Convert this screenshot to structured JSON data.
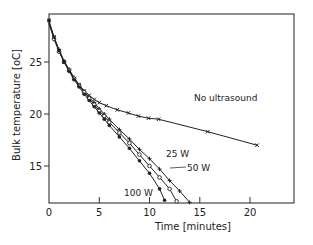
{
  "chart_data": {
    "type": "line",
    "title": "",
    "xlabel": "Time [minutes]",
    "ylabel": "Bulk temperature [oC]",
    "xlim": [
      0,
      24.5
    ],
    "ylim": [
      11.4,
      29.6
    ],
    "xticks": [
      0,
      5,
      10,
      15,
      20
    ],
    "yticks": [
      15,
      20,
      25
    ],
    "grid": false,
    "legend": "inline labels",
    "series": [
      {
        "name": "No ultrasound",
        "marker": "x",
        "label_pos": [
          9.5,
          20.3
        ],
        "x": [
          0,
          0.5,
          1,
          1.5,
          2,
          2.5,
          3,
          3.5,
          4,
          4.5,
          5,
          5.7,
          6.8,
          7.9,
          8.9,
          9.9,
          10.9,
          15.8,
          20.7
        ],
        "y": [
          28.7,
          27.4,
          26.1,
          25.0,
          24.2,
          23.4,
          22.8,
          22.2,
          21.8,
          21.4,
          21.1,
          20.8,
          20.4,
          20.1,
          19.8,
          19.6,
          19.5,
          18.3,
          17.0
        ]
      },
      {
        "name": "25 W",
        "marker": "+",
        "label_pos": [
          11.4,
          14.8
        ],
        "x": [
          0,
          0.5,
          1,
          1.5,
          2,
          2.5,
          3,
          3.5,
          4,
          4.5,
          5,
          5.5,
          6,
          7,
          8,
          9,
          10,
          11,
          12,
          13,
          14
        ],
        "y": [
          28.8,
          27.3,
          26.2,
          25.1,
          24.3,
          23.5,
          22.8,
          22.2,
          21.6,
          21.1,
          20.5,
          20.0,
          19.5,
          18.5,
          17.6,
          16.6,
          15.7,
          14.7,
          13.6,
          12.6,
          11.5
        ]
      },
      {
        "name": "50 W",
        "marker": "o",
        "label_pos": [
          13.1,
          13.3
        ],
        "x": [
          0,
          0.5,
          1,
          1.5,
          2,
          2.5,
          3,
          3.5,
          4,
          4.5,
          5,
          5.5,
          6,
          7,
          8,
          9,
          10,
          11,
          12,
          12.7
        ],
        "y": [
          28.7,
          27.2,
          26.0,
          25.0,
          24.2,
          23.4,
          22.7,
          22.1,
          21.5,
          20.9,
          20.3,
          19.8,
          19.2,
          18.2,
          17.2,
          16.1,
          15.0,
          13.9,
          12.8,
          11.6
        ]
      },
      {
        "name": "100 W",
        "marker": "filled-circle",
        "label_pos": [
          5.3,
          12.3
        ],
        "x": [
          0,
          0.5,
          1,
          1.5,
          2,
          2.5,
          3,
          3.5,
          4,
          4.5,
          5,
          5.5,
          6,
          7,
          8,
          9,
          10,
          11,
          11.5
        ],
        "y": [
          29.0,
          27.4,
          26.1,
          25.0,
          24.1,
          23.3,
          22.6,
          21.9,
          21.3,
          20.7,
          20.1,
          19.5,
          18.9,
          17.8,
          16.7,
          15.5,
          14.3,
          12.8,
          11.7
        ]
      }
    ]
  },
  "axes": {
    "x_label": "Time [minutes]",
    "y_label": "Bulk temperature [oC]",
    "x_ticks": [
      "0",
      "5",
      "10",
      "15",
      "20"
    ],
    "y_ticks": [
      "25",
      "20",
      "15"
    ]
  },
  "labels": {
    "no_ultrasound": "No ultrasound",
    "w25": "25 W",
    "w50": "50 W",
    "w100": "100 W"
  }
}
